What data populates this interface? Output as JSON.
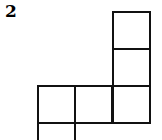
{
  "figure": {
    "label": "2",
    "line_color": "#111111",
    "cells": [
      {
        "col": 3,
        "row": 0
      },
      {
        "col": 3,
        "row": 1
      },
      {
        "col": 1,
        "row": 2
      },
      {
        "col": 2,
        "row": 2
      },
      {
        "col": 3,
        "row": 2
      },
      {
        "col": 1,
        "row": 3
      }
    ]
  }
}
